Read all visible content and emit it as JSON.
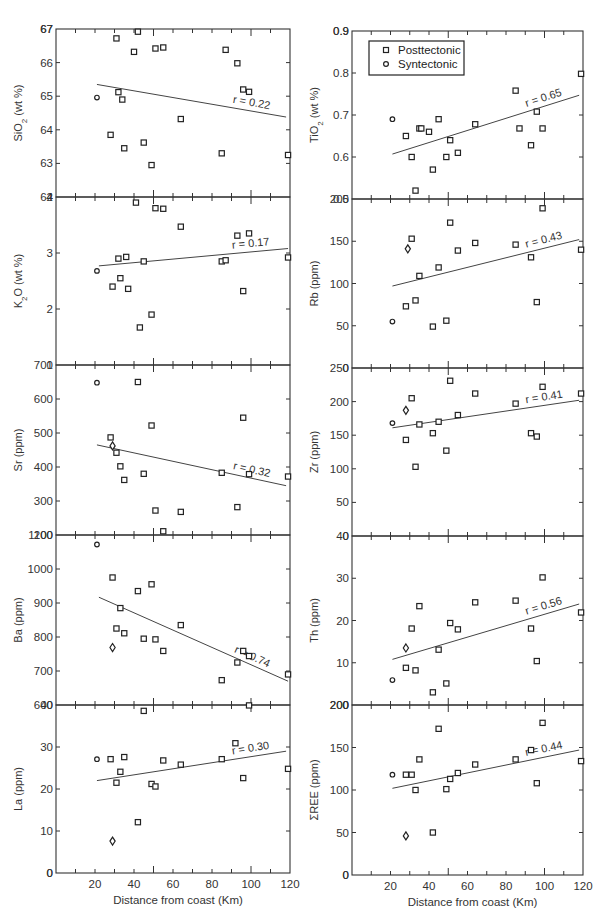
{
  "legend": {
    "items": [
      {
        "label": "Posttectonic",
        "marker": "square"
      },
      {
        "label": "Syntectonic",
        "marker": "circle"
      }
    ]
  },
  "chart_data": [
    {
      "type": "scatter",
      "column": "left",
      "panel": 0,
      "ylabel": "SiO2 (wt %)",
      "ylabel_sub": "2",
      "ylabel_pre": "SiO",
      "ylabel_post": " (wt %)",
      "xlabel": "",
      "xlim": [
        0,
        120
      ],
      "ylim": [
        62,
        67
      ],
      "yticks": [
        63,
        64,
        65,
        66,
        67
      ],
      "yticklabels": [
        "63",
        "64",
        "65",
        "66",
        "67"
      ],
      "r_label": "r = 0.22",
      "trend": {
        "x": [
          21,
          118
        ],
        "y": [
          65.35,
          64.38
        ]
      },
      "posttectonic": [
        [
          28,
          63.85
        ],
        [
          31,
          66.72
        ],
        [
          32,
          65.12
        ],
        [
          34,
          64.9
        ],
        [
          35,
          63.45
        ],
        [
          40,
          66.32
        ],
        [
          42,
          66.92
        ],
        [
          45,
          63.62
        ],
        [
          49,
          62.95
        ],
        [
          51,
          66.42
        ],
        [
          55,
          66.45
        ],
        [
          64,
          64.32
        ],
        [
          85,
          63.3
        ],
        [
          87,
          66.38
        ],
        [
          93,
          65.98
        ],
        [
          96,
          65.2
        ],
        [
          99,
          65.13
        ],
        [
          119,
          63.25
        ]
      ],
      "syntectonic": [
        [
          21,
          64.96
        ]
      ],
      "diamond": []
    },
    {
      "type": "scatter",
      "column": "left",
      "panel": 1,
      "ylabel_pre": "K",
      "ylabel_sub": "2",
      "ylabel_post": "O (wt %)",
      "xlabel": "",
      "xlim": [
        0,
        120
      ],
      "ylim": [
        1,
        4
      ],
      "yticks": [
        2,
        3,
        4
      ],
      "yticklabels": [
        "2",
        "3",
        "4"
      ],
      "r_label": "r = 0.17",
      "trend": {
        "x": [
          22,
          119
        ],
        "y": [
          2.77,
          3.08
        ]
      },
      "posttectonic": [
        [
          29,
          2.4
        ],
        [
          32,
          2.9
        ],
        [
          33,
          2.55
        ],
        [
          36,
          2.93
        ],
        [
          37,
          2.36
        ],
        [
          41,
          3.9
        ],
        [
          43,
          1.67
        ],
        [
          45,
          2.85
        ],
        [
          49,
          1.9
        ],
        [
          51,
          3.8
        ],
        [
          55,
          3.79
        ],
        [
          64,
          3.47
        ],
        [
          85,
          2.85
        ],
        [
          87,
          2.87
        ],
        [
          93,
          3.31
        ],
        [
          96,
          2.32
        ],
        [
          99,
          3.35
        ],
        [
          119,
          2.92
        ]
      ],
      "syntectonic": [
        [
          21,
          2.68
        ]
      ],
      "diamond": []
    },
    {
      "type": "scatter",
      "column": "left",
      "panel": 2,
      "ylabel_pre": "Sr (ppm)",
      "ylabel_sub": "",
      "ylabel_post": "",
      "xlabel": "",
      "xlim": [
        0,
        120
      ],
      "ylim": [
        200,
        700
      ],
      "yticks": [
        300,
        400,
        500,
        600
      ],
      "yticklabels": [
        "300",
        "400",
        "500",
        "600"
      ],
      "r_label": "r = 0.32",
      "trend": {
        "x": [
          21,
          118
        ],
        "y": [
          465,
          345
        ]
      },
      "posttectonic": [
        [
          28,
          487
        ],
        [
          31,
          442
        ],
        [
          33,
          402
        ],
        [
          35,
          362
        ],
        [
          42,
          650
        ],
        [
          45,
          380
        ],
        [
          49,
          522
        ],
        [
          51,
          272
        ],
        [
          55,
          211
        ],
        [
          64,
          268
        ],
        [
          85,
          383
        ],
        [
          93,
          282
        ],
        [
          96,
          545
        ],
        [
          99,
          379
        ],
        [
          119,
          372
        ]
      ],
      "syntectonic": [
        [
          21,
          648
        ]
      ],
      "diamond": [
        [
          29,
          462
        ]
      ]
    },
    {
      "type": "scatter",
      "column": "left",
      "panel": 3,
      "ylabel_pre": "Ba (ppm)",
      "ylabel_sub": "",
      "ylabel_post": "",
      "xlabel": "",
      "xlim": [
        0,
        120
      ],
      "ylim": [
        600,
        1100
      ],
      "yticks": [
        700,
        800,
        900,
        1000
      ],
      "yticklabels": [
        "700",
        "800",
        "900",
        "1000"
      ],
      "r_label": "r = 0.74",
      "trend": {
        "x": [
          22,
          119
        ],
        "y": [
          917,
          670
        ]
      },
      "posttectonic": [
        [
          29,
          975
        ],
        [
          31,
          825
        ],
        [
          33,
          885
        ],
        [
          35,
          811
        ],
        [
          42,
          935
        ],
        [
          45,
          795
        ],
        [
          49,
          955
        ],
        [
          51,
          793
        ],
        [
          55,
          759
        ],
        [
          64,
          835
        ],
        [
          85,
          673
        ],
        [
          93,
          725
        ],
        [
          96,
          759
        ],
        [
          99,
          744
        ],
        [
          119,
          690
        ]
      ],
      "syntectonic": [
        [
          21,
          1072
        ]
      ],
      "diamond": [
        [
          29,
          769
        ]
      ]
    },
    {
      "type": "scatter",
      "column": "left",
      "panel": 4,
      "ylabel_pre": "La (ppm)",
      "ylabel_sub": "",
      "ylabel_post": "",
      "xlabel": "Distance from coast (Km)",
      "xlim": [
        0,
        120
      ],
      "ylim": [
        0,
        40
      ],
      "yticks": [
        0,
        10,
        20,
        30
      ],
      "yticklabels": [
        "0",
        "10",
        "20",
        "30"
      ],
      "xticks": [
        20,
        40,
        60,
        80,
        100,
        120
      ],
      "xticklabels": [
        "20",
        "40",
        "60",
        "80",
        "100",
        "120"
      ],
      "r_label": "r = 0.30",
      "trend": {
        "x": [
          21,
          118
        ],
        "y": [
          22.0,
          29.0
        ]
      },
      "posttectonic": [
        [
          28,
          27.1
        ],
        [
          31,
          21.5
        ],
        [
          33,
          24.1
        ],
        [
          35,
          27.6
        ],
        [
          42,
          12.1
        ],
        [
          45,
          38.6
        ],
        [
          49,
          21.2
        ],
        [
          51,
          20.6
        ],
        [
          55,
          26.8
        ],
        [
          64,
          25.8
        ],
        [
          85,
          27.1
        ],
        [
          92,
          30.9
        ],
        [
          96,
          22.6
        ],
        [
          99,
          39.9
        ],
        [
          119,
          24.8
        ]
      ],
      "syntectonic": [
        [
          21,
          27.1
        ]
      ],
      "diamond": [
        [
          29,
          7.6
        ]
      ]
    },
    {
      "type": "scatter",
      "column": "right",
      "panel": 0,
      "ylabel_pre": "TiO",
      "ylabel_sub": "2",
      "ylabel_post": " (wt %)",
      "xlabel": "",
      "xlim": [
        0,
        120
      ],
      "ylim": [
        0.5,
        0.9
      ],
      "yticks": [
        0.6,
        0.7,
        0.8,
        0.9
      ],
      "yticklabels": [
        "0.6",
        "0.7",
        "0.8",
        "0.9"
      ],
      "r_label": "r = 0.65",
      "trend": {
        "x": [
          21,
          118
        ],
        "y": [
          0.607,
          0.747
        ]
      },
      "posttectonic": [
        [
          28,
          0.65
        ],
        [
          31,
          0.6
        ],
        [
          33,
          0.52
        ],
        [
          35,
          0.668
        ],
        [
          36,
          0.668
        ],
        [
          40,
          0.66
        ],
        [
          42,
          0.57
        ],
        [
          45,
          0.69
        ],
        [
          49,
          0.6
        ],
        [
          51,
          0.64
        ],
        [
          55,
          0.61
        ],
        [
          64,
          0.678
        ],
        [
          85,
          0.758
        ],
        [
          87,
          0.668
        ],
        [
          93,
          0.628
        ],
        [
          96,
          0.708
        ],
        [
          99,
          0.668
        ],
        [
          119,
          0.798
        ]
      ],
      "syntectonic": [
        [
          21,
          0.69
        ]
      ],
      "diamond": []
    },
    {
      "type": "scatter",
      "column": "right",
      "panel": 1,
      "ylabel_pre": "Rb (ppm)",
      "ylabel_sub": "",
      "ylabel_post": "",
      "xlabel": "",
      "xlim": [
        0,
        120
      ],
      "ylim": [
        0,
        200
      ],
      "yticks": [
        50,
        100,
        150
      ],
      "yticklabels": [
        "50",
        "100",
        "150"
      ],
      "r_label": "r = 0.43",
      "trend": {
        "x": [
          21,
          118
        ],
        "y": [
          97,
          152
        ]
      },
      "posttectonic": [
        [
          28,
          73
        ],
        [
          31,
          153
        ],
        [
          33,
          80
        ],
        [
          35,
          109
        ],
        [
          42,
          49
        ],
        [
          45,
          119
        ],
        [
          49,
          56
        ],
        [
          51,
          172
        ],
        [
          55,
          139
        ],
        [
          64,
          148
        ],
        [
          85,
          146
        ],
        [
          93,
          131
        ],
        [
          96,
          78
        ],
        [
          99,
          189
        ],
        [
          119,
          140
        ]
      ],
      "syntectonic": [
        [
          21,
          55
        ]
      ],
      "diamond": [
        [
          29,
          141
        ]
      ]
    },
    {
      "type": "scatter",
      "column": "right",
      "panel": 2,
      "ylabel_pre": "Zr (ppm)",
      "ylabel_sub": "",
      "ylabel_post": "",
      "xlabel": "",
      "xlim": [
        0,
        120
      ],
      "ylim": [
        0,
        250
      ],
      "yticks": [
        50,
        100,
        150,
        200
      ],
      "yticklabels": [
        "50",
        "100",
        "150",
        "200"
      ],
      "r_label": "r = 0.41",
      "trend": {
        "x": [
          21,
          118
        ],
        "y": [
          161,
          202
        ]
      },
      "posttectonic": [
        [
          28,
          143
        ],
        [
          31,
          205
        ],
        [
          33,
          103
        ],
        [
          35,
          166
        ],
        [
          42,
          153
        ],
        [
          45,
          170
        ],
        [
          49,
          127
        ],
        [
          51,
          231
        ],
        [
          55,
          180
        ],
        [
          64,
          212
        ],
        [
          85,
          197
        ],
        [
          93,
          153
        ],
        [
          96,
          148
        ],
        [
          99,
          222
        ],
        [
          119,
          212
        ]
      ],
      "syntectonic": [
        [
          21,
          168
        ]
      ],
      "diamond": [
        [
          28,
          187
        ]
      ]
    },
    {
      "type": "scatter",
      "column": "right",
      "panel": 3,
      "ylabel_pre": "Th (ppm)",
      "ylabel_sub": "",
      "ylabel_post": "",
      "xlabel": "",
      "xlim": [
        0,
        120
      ],
      "ylim": [
        0,
        40
      ],
      "yticks": [
        10,
        20,
        30
      ],
      "yticklabels": [
        "10",
        "20",
        "30"
      ],
      "r_label": "r = 0.56",
      "trend": {
        "x": [
          21,
          118
        ],
        "y": [
          10.8,
          23.9
        ]
      },
      "posttectonic": [
        [
          28,
          8.8
        ],
        [
          31,
          18.1
        ],
        [
          33,
          8.2
        ],
        [
          35,
          23.4
        ],
        [
          42,
          3.0
        ],
        [
          45,
          13.1
        ],
        [
          49,
          5.1
        ],
        [
          51,
          19.4
        ],
        [
          55,
          17.9
        ],
        [
          64,
          24.3
        ],
        [
          85,
          24.7
        ],
        [
          93,
          18.1
        ],
        [
          96,
          10.4
        ],
        [
          99,
          30.2
        ],
        [
          119,
          21.9
        ]
      ],
      "syntectonic": [
        [
          21,
          5.9
        ]
      ],
      "diamond": [
        [
          28,
          13.5
        ]
      ]
    },
    {
      "type": "scatter",
      "column": "right",
      "panel": 4,
      "ylabel_pre": "ΣREE (ppm)",
      "ylabel_sub": "",
      "ylabel_post": "",
      "xlabel": "Distance from coast (Km)",
      "xlim": [
        0,
        120
      ],
      "ylim": [
        0,
        200
      ],
      "yticks": [
        0,
        50,
        100,
        150,
        200
      ],
      "yticklabels": [
        "0",
        "50",
        "100",
        "150",
        "200"
      ],
      "xticks": [
        20,
        40,
        60,
        80,
        100,
        120
      ],
      "xticklabels": [
        "20",
        "40",
        "60",
        "80",
        "100",
        "120"
      ],
      "r_label": "r = 0.44",
      "trend": {
        "x": [
          21,
          118
        ],
        "y": [
          102,
          147
        ]
      },
      "posttectonic": [
        [
          28,
          118
        ],
        [
          31,
          118
        ],
        [
          33,
          100
        ],
        [
          35,
          136
        ],
        [
          42,
          50
        ],
        [
          45,
          172
        ],
        [
          49,
          101
        ],
        [
          51,
          113
        ],
        [
          55,
          120
        ],
        [
          64,
          130
        ],
        [
          85,
          136
        ],
        [
          93,
          147
        ],
        [
          96,
          108
        ],
        [
          99,
          179
        ],
        [
          119,
          134
        ]
      ],
      "syntectonic": [
        [
          21,
          118
        ]
      ],
      "diamond": [
        [
          28,
          46
        ]
      ]
    }
  ]
}
